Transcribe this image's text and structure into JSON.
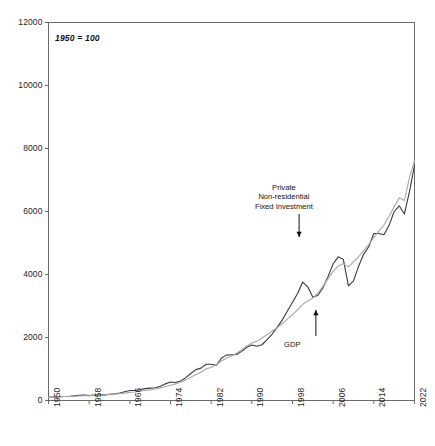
{
  "figure": {
    "note": "1950 = 100",
    "background_color": "#ffffff",
    "axis_color": "#6b6b6b"
  },
  "annotations": [
    {
      "id": "pnfi",
      "label": "Private\nNon-residential\nFixed Investment",
      "lines": [
        "Private",
        "Non-residential",
        "Fixed Investment"
      ],
      "arrow_direction": "down",
      "target_series": "Private Non-residential Fixed Investment"
    },
    {
      "id": "gdp",
      "label": "GDP",
      "lines": [
        "GDP"
      ],
      "arrow_direction": "up",
      "target_series": "GDP"
    }
  ],
  "chart_data": {
    "type": "line",
    "title": "",
    "subtitle": "",
    "note": "1950 = 100",
    "xlabel": "",
    "ylabel": "",
    "xlim": [
      1950,
      2022
    ],
    "ylim": [
      0,
      12000
    ],
    "grid": false,
    "legend_position": "inline-annotation",
    "xticks": [
      1950,
      1958,
      1966,
      1974,
      1982,
      1990,
      1998,
      2006,
      2014,
      2022
    ],
    "xtick_labels": [
      "1950",
      "1958",
      "1966",
      "1974",
      "1982",
      "1990",
      "1998",
      "2006",
      "2014",
      "2022"
    ],
    "xtick_rotation": 90,
    "yticks": [
      0,
      2000,
      4000,
      6000,
      8000,
      10000,
      12000
    ],
    "ytick_labels": [
      "0",
      "2000",
      "4000",
      "6000",
      "8000",
      "10000",
      "12000"
    ],
    "x": [
      1950,
      1951,
      1952,
      1953,
      1954,
      1955,
      1956,
      1957,
      1958,
      1959,
      1960,
      1961,
      1962,
      1963,
      1964,
      1965,
      1966,
      1967,
      1968,
      1969,
      1970,
      1971,
      1972,
      1973,
      1974,
      1975,
      1976,
      1977,
      1978,
      1979,
      1980,
      1981,
      1982,
      1983,
      1984,
      1985,
      1986,
      1987,
      1988,
      1989,
      1990,
      1991,
      1992,
      1993,
      1994,
      1995,
      1996,
      1997,
      1998,
      1999,
      2000,
      2001,
      2002,
      2003,
      2004,
      2005,
      2006,
      2007,
      2008,
      2009,
      2010,
      2011,
      2012,
      2013,
      2014,
      2015,
      2016,
      2017,
      2018,
      2019,
      2020,
      2021,
      2022
    ],
    "series": [
      {
        "name": "Private Non-residential Fixed Investment",
        "color": "#3a3a3a",
        "line_width": 1.1,
        "values": [
          100,
          112,
          116,
          126,
          128,
          146,
          168,
          176,
          156,
          170,
          180,
          180,
          196,
          210,
          236,
          278,
          316,
          318,
          340,
          378,
          392,
          404,
          452,
          528,
          586,
          570,
          622,
          724,
          856,
          980,
          1028,
          1152,
          1152,
          1120,
          1340,
          1440,
          1450,
          1462,
          1560,
          1690,
          1760,
          1720,
          1770,
          1930,
          2110,
          2330,
          2560,
          2840,
          3120,
          3400,
          3760,
          3610,
          3280,
          3340,
          3580,
          3940,
          4340,
          4560,
          4480,
          3640,
          3800,
          4260,
          4640,
          4880,
          5300,
          5300,
          5260,
          5560,
          6000,
          6180,
          5920,
          6620,
          7460
        ]
      },
      {
        "name": "GDP",
        "color": "#a8a8a8",
        "line_width": 1.1,
        "values": [
          100,
          112,
          118,
          125,
          126,
          137,
          145,
          152,
          155,
          167,
          173,
          179,
          192,
          202,
          217,
          235,
          257,
          271,
          295,
          319,
          336,
          364,
          400,
          447,
          485,
          527,
          588,
          655,
          739,
          824,
          898,
          1004,
          1047,
          1133,
          1255,
          1341,
          1414,
          1500,
          1610,
          1730,
          1828,
          1885,
          1982,
          2086,
          2208,
          2311,
          2443,
          2591,
          2723,
          2880,
          3055,
          3160,
          3253,
          3406,
          3629,
          3870,
          4097,
          4273,
          4346,
          4243,
          4400,
          4564,
          4757,
          4947,
          5175,
          5379,
          5572,
          5848,
          6155,
          6433,
          6349,
          7075,
          7610
        ]
      }
    ]
  }
}
